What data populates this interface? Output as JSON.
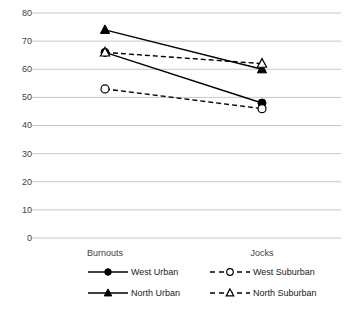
{
  "chart_data": {
    "type": "line",
    "title": "",
    "subtitle": "",
    "xlabel": "",
    "ylabel": "",
    "categories": [
      "Burnouts",
      "Jocks"
    ],
    "x": [
      0,
      1
    ],
    "ylim": [
      0,
      80
    ],
    "yticks": [
      0,
      10,
      20,
      30,
      40,
      50,
      60,
      70,
      80
    ],
    "ytick_labels": [
      "0",
      "10",
      "20",
      "30",
      "40",
      "50",
      "60",
      "70",
      "80"
    ],
    "grid": true,
    "grid_axis": "y",
    "legend_position": "bottom",
    "legend_columns": 2,
    "series": [
      {
        "name": "West Urban",
        "values": [
          66,
          48
        ],
        "linestyle": "solid",
        "marker": "filled-circle",
        "color": "#000000"
      },
      {
        "name": "North Urban",
        "values": [
          74,
          60
        ],
        "linestyle": "solid",
        "marker": "filled-triangle",
        "color": "#000000"
      },
      {
        "name": "West Suburban",
        "values": [
          53,
          46
        ],
        "linestyle": "dashed",
        "marker": "open-circle",
        "color": "#000000"
      },
      {
        "name": "North Suburban",
        "values": [
          66,
          62
        ],
        "linestyle": "dashed",
        "marker": "open-triangle",
        "color": "#000000"
      }
    ]
  },
  "axis": {
    "y_labels": [
      "80",
      "70",
      "60",
      "50",
      "40",
      "30",
      "20",
      "10",
      "0"
    ],
    "x_labels": [
      "Burnouts",
      "Jocks"
    ]
  },
  "legend": {
    "items": [
      {
        "label": "West Urban"
      },
      {
        "label": "West Suburban"
      },
      {
        "label": "North Urban"
      },
      {
        "label": "North Suburban"
      }
    ]
  },
  "colors": {
    "gridline": "#c8c8c8",
    "series": "#000000",
    "tick_text": "#404040",
    "legend_text": "#1a1a1a",
    "background": "#ffffff"
  }
}
